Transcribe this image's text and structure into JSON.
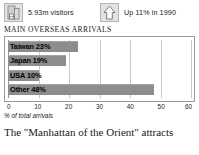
{
  "stats": [
    {
      "icon": "hotel-building-icon",
      "label": "5.93m visitors"
    },
    {
      "icon": "up-arrow-box-icon",
      "label": "Up 11% in 1990"
    }
  ],
  "section_title": "MAIN OVERSEAS ARRIVALS",
  "axis_caption": "% of total arrivals",
  "body_text": "The \"Manhattan of the Orient\" attracts",
  "colors": {
    "bar_fill": "#8d8d8d",
    "grid": "#c9c9c9",
    "frame": "#9b9b9b",
    "text": "#1a1a1a"
  },
  "chart_data": {
    "type": "bar",
    "orientation": "horizontal",
    "title": "MAIN OVERSEAS ARRIVALS",
    "categories": [
      "Taiwan",
      "Japan",
      "USA",
      "Other"
    ],
    "values": [
      23,
      19,
      10,
      48
    ],
    "bar_labels": [
      "Taiwan 23%",
      "Japan 19%",
      "USA 10%",
      "Other 48%"
    ],
    "xlabel": "% of total arrivals",
    "ylabel": "",
    "xlim": [
      0,
      60
    ],
    "xticks": [
      0,
      10,
      20,
      30,
      40,
      50,
      60
    ],
    "xtick_labels": [
      "0",
      "10",
      "20",
      "30",
      "40",
      "50",
      "60"
    ],
    "grid": true,
    "legend": false,
    "series_color": "#8d8d8d"
  }
}
